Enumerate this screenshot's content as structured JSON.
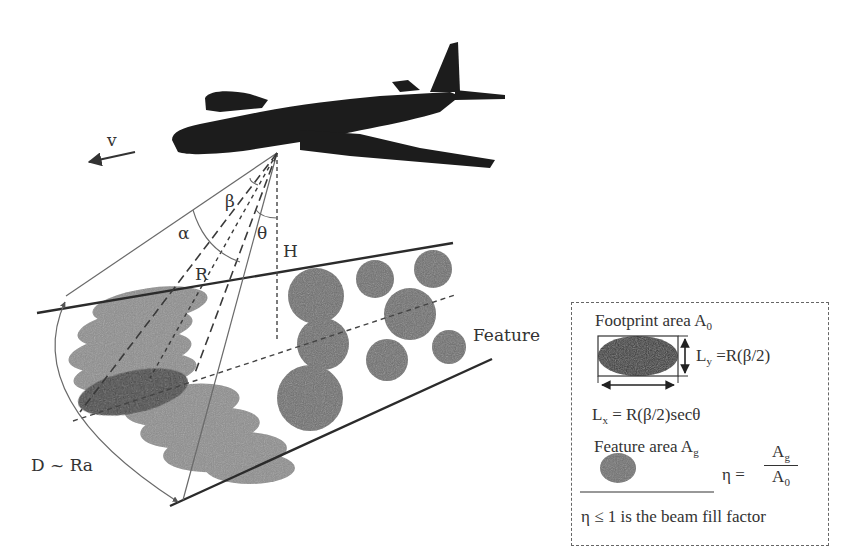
{
  "figure": {
    "labels": {
      "velocity": "v",
      "alpha": "α",
      "beta": "β",
      "theta": "θ",
      "range": "R",
      "height": "H",
      "swath_width": "D ~ Ra",
      "feature": "Feature"
    }
  },
  "legend": {
    "footprint_title": "Footprint area A",
    "footprint_sub": "0",
    "ly_label": "L",
    "ly_sub": "y",
    "ly_formula": " =R(β/2)",
    "lx_label": "L",
    "lx_sub": "x",
    "lx_formula": " = R(β/2)secθ",
    "feature_title": "Feature area A",
    "feature_sub": "g",
    "eta_symbol": "η =",
    "eta_num": "A",
    "eta_num_sub": "g",
    "eta_den": "A",
    "eta_den_sub": "0",
    "footnote": "η ≤ 1 is the beam fill factor"
  },
  "colors": {
    "background": "#ffffff",
    "aircraft": "#1c1c1c",
    "footprint_dark": "#3a3a3a",
    "footprint_light": "#8c8c8c",
    "feature": "#6e6e6e",
    "line": "#2b2b2b",
    "thin_line": "#6a6a6a"
  }
}
